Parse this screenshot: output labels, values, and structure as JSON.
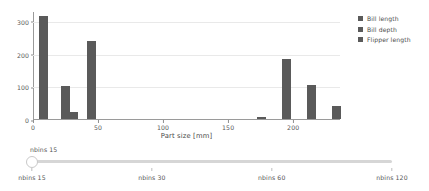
{
  "chart_data": {
    "type": "bar",
    "title": "",
    "xlabel": "Part size [mm]",
    "ylabel": "",
    "xlim": [
      0,
      236
    ],
    "ylim": [
      0,
      330
    ],
    "grid": true,
    "bar_color": "#5a5a5a",
    "xticks": [
      "0",
      "50",
      "100",
      "150",
      "200"
    ],
    "xtick_values": [
      0,
      50,
      100,
      150,
      200
    ],
    "yticks": [
      "0",
      "100",
      "200",
      "300"
    ],
    "ytick_values": [
      0,
      100,
      200,
      300
    ],
    "legend_position": "right",
    "series": [
      {
        "name": "Bill length",
        "color": "#5a5a5a",
        "x": [
          25,
          45
        ],
        "values": [
          100,
          238
        ]
      },
      {
        "name": "Bill depth",
        "color": "#5a5a5a",
        "x": [
          8,
          31
        ],
        "values": [
          316,
          22
        ]
      },
      {
        "name": "Flipper length",
        "color": "#5a5a5a",
        "x": [
          176,
          195,
          214,
          233
        ],
        "values": [
          5,
          182,
          105,
          40
        ]
      }
    ],
    "bars": [
      {
        "x": 8,
        "value": 316,
        "width": 7
      },
      {
        "x": 25,
        "value": 100,
        "width": 7
      },
      {
        "x": 31,
        "value": 22,
        "width": 7
      },
      {
        "x": 45,
        "value": 238,
        "width": 7
      },
      {
        "x": 176,
        "value": 5,
        "width": 7
      },
      {
        "x": 195,
        "value": 182,
        "width": 7
      },
      {
        "x": 214,
        "value": 105,
        "width": 7
      },
      {
        "x": 233,
        "value": 40,
        "width": 7
      }
    ]
  },
  "legend": {
    "items": [
      {
        "label": "Bill length",
        "color": "#5a5a5a"
      },
      {
        "label": "Bill depth",
        "color": "#5a5a5a"
      },
      {
        "label": "Flipper length",
        "color": "#5a5a5a"
      }
    ]
  },
  "slider": {
    "name": "nbins-slider",
    "value_label": "nbins 15",
    "handle_position_pct": 0,
    "ticks": [
      {
        "label": "nbins 15",
        "position_pct": 0
      },
      {
        "label": "nbins 30",
        "position_pct": 33.3
      },
      {
        "label": "nbins 60",
        "position_pct": 66.6
      },
      {
        "label": "nbins 120",
        "position_pct": 100
      }
    ]
  }
}
